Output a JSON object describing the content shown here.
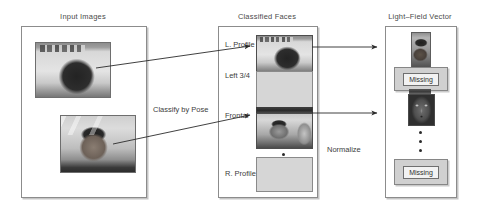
{
  "figure": {
    "type": "pipeline-diagram",
    "panels": [
      {
        "id": "input-images",
        "title": "Input Images"
      },
      {
        "id": "classified-faces",
        "title": "Classified Faces"
      },
      {
        "id": "light-field-vector",
        "title": "Light–Field Vector"
      }
    ],
    "flow_labels": [
      {
        "id": "classify-by-pose",
        "text": "Classify by Pose"
      },
      {
        "id": "normalize",
        "text": "Normalize"
      }
    ],
    "pose_labels": [
      {
        "id": "l-profile",
        "text": "L. Profile"
      },
      {
        "id": "left-34",
        "text": "Left 3/4"
      },
      {
        "id": "frontal",
        "text": "Frontal"
      },
      {
        "id": "r-profile",
        "text": "R. Profile"
      }
    ],
    "classified_cells": [
      {
        "pose": "L. Profile",
        "state": "filled",
        "content": "left-profile-face-photo"
      },
      {
        "pose": "Left 3/4",
        "state": "empty",
        "content": ""
      },
      {
        "pose": "Frontal",
        "state": "filled",
        "content": "frontal-face-photo"
      },
      {
        "pose": "R. Profile",
        "state": "empty",
        "content": ""
      }
    ],
    "light_field_slots": [
      {
        "state": "filled",
        "content": "profile-face-strip",
        "label": ""
      },
      {
        "state": "missing",
        "content": "",
        "label": "Missing"
      },
      {
        "state": "filled",
        "content": "normalized-frontal-face",
        "label": ""
      },
      {
        "state": "missing",
        "content": "",
        "label": "Missing"
      }
    ],
    "input_photos": [
      {
        "id": "input-photo-1",
        "content": "man-left-profile-office"
      },
      {
        "id": "input-photo-2",
        "content": "man-frontal-tent"
      }
    ],
    "ellipsis": "⋮",
    "colors": {
      "panel_border": "#8c8c8c",
      "text": "#3d3d3d",
      "empty_slot": "#d6d6d6",
      "missing_box": "#d0d0d0",
      "arrow": "#2b2b2b",
      "background": "#ffffff"
    }
  }
}
